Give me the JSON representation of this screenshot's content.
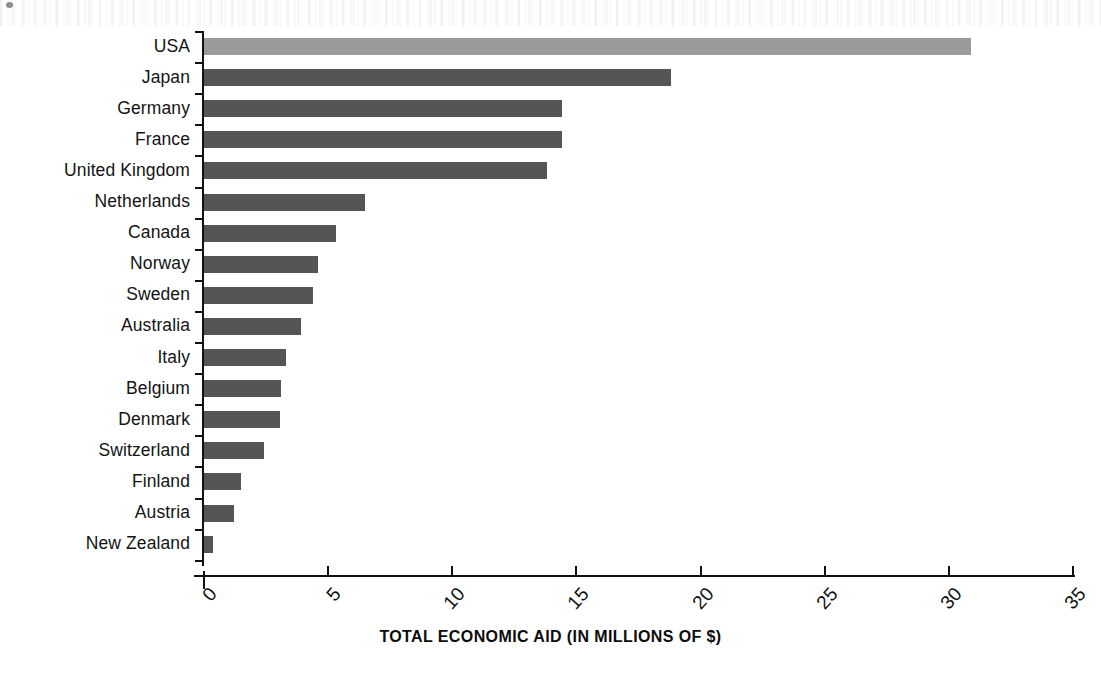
{
  "chart_data": {
    "type": "bar",
    "orientation": "horizontal",
    "title": "",
    "xlabel": "TOTAL ECONOMIC AID (IN MILLIONS OF $)",
    "ylabel": "",
    "xlim": [
      0,
      35
    ],
    "xticks": [
      "0",
      "5",
      "10",
      "15",
      "20",
      "25",
      "30",
      "35"
    ],
    "xtick_values": [
      0,
      5,
      10,
      15,
      20,
      25,
      30,
      35
    ],
    "grid": false,
    "legend": "none",
    "categories": [
      "USA",
      "Japan",
      "Germany",
      "France",
      "United Kingdom",
      "Netherlands",
      "Canada",
      "Norway",
      "Sweden",
      "Australia",
      "Italy",
      "Belgium",
      "Denmark",
      "Switzerland",
      "Finland",
      "Austria",
      "New Zealand"
    ],
    "values": [
      30.9,
      18.8,
      14.4,
      14.4,
      13.8,
      6.5,
      5.3,
      4.6,
      4.4,
      3.9,
      3.3,
      3.1,
      3.05,
      2.4,
      1.5,
      1.2,
      0.35
    ],
    "bar_colors": [
      "#9a9a9a",
      "#555555",
      "#555555",
      "#555555",
      "#555555",
      "#555555",
      "#555555",
      "#555555",
      "#555555",
      "#555555",
      "#555555",
      "#555555",
      "#555555",
      "#555555",
      "#555555",
      "#555555",
      "#555555"
    ],
    "highlight_category": "USA",
    "highlight_color": "#9a9a9a",
    "default_bar_color": "#555555",
    "axis_color": "#111111"
  }
}
